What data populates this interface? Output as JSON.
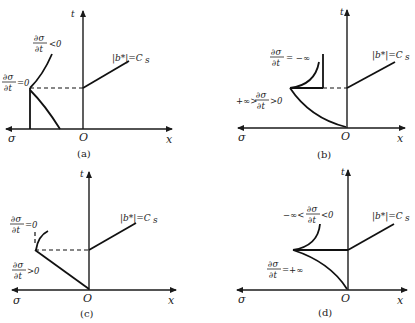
{
  "figure": {
    "panels": [
      {
        "id": "a",
        "caption": "(a)",
        "axis_labels": {
          "t": "t",
          "sigma": "σ",
          "origin": "O",
          "x": "x"
        },
        "line_label": "|b*|=C",
        "line_label_sub": "s",
        "annotations": [
          {
            "num": "∂σ",
            "den": "∂t",
            "suffix": "<0",
            "prefix": ""
          },
          {
            "num": "∂σ",
            "den": "∂t",
            "suffix": "=0",
            "prefix": ""
          }
        ]
      },
      {
        "id": "b",
        "caption": "(b)",
        "axis_labels": {
          "t": "t",
          "sigma": "σ",
          "origin": "O",
          "x": "x"
        },
        "line_label": "|b*|=C",
        "line_label_sub": "s",
        "annotations": [
          {
            "num": "∂σ",
            "den": "∂t",
            "suffix": "= −∞",
            "prefix": ""
          },
          {
            "num": "∂σ",
            "den": "∂t",
            "suffix": ">0",
            "prefix": "+∞>"
          }
        ]
      },
      {
        "id": "c",
        "caption": "(c)",
        "axis_labels": {
          "t": "t",
          "sigma": "σ",
          "origin": "O",
          "x": "x"
        },
        "line_label": "|b*|=C",
        "line_label_sub": "s",
        "annotations": [
          {
            "num": "∂σ",
            "den": "∂t",
            "suffix": "=0",
            "prefix": ""
          },
          {
            "num": "∂σ",
            "den": "∂t",
            "suffix": ">0",
            "prefix": ""
          }
        ]
      },
      {
        "id": "d",
        "caption": "(d)",
        "axis_labels": {
          "t": "t",
          "sigma": "σ",
          "origin": "O",
          "x": "x"
        },
        "line_label": "|b*|=C",
        "line_label_sub": "s",
        "annotations": [
          {
            "num": "∂σ",
            "den": "∂t",
            "suffix": "<0",
            "prefix": "−∞<"
          },
          {
            "num": "∂σ",
            "den": "∂t",
            "suffix": "=+∞",
            "prefix": ""
          }
        ]
      }
    ]
  }
}
